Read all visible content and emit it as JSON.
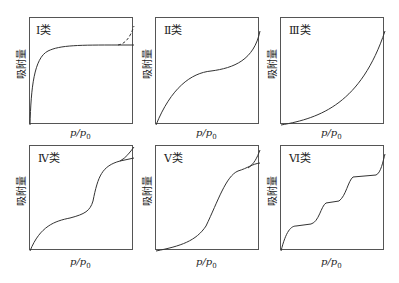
{
  "figure": {
    "ylabel": "吸附量",
    "xlabel_p": "p",
    "xlabel_sep": "/",
    "xlabel_p0": "p",
    "xlabel_sub": "0",
    "panels": [
      {
        "title": "Ⅰ类",
        "type": "I"
      },
      {
        "title": "Ⅱ类",
        "type": "II"
      },
      {
        "title": "Ⅲ类",
        "type": "III"
      },
      {
        "title": "Ⅳ类",
        "type": "IV"
      },
      {
        "title": "Ⅴ类",
        "type": "V"
      },
      {
        "title": "Ⅵ类",
        "type": "VI"
      }
    ]
  },
  "colors": {
    "line": "#333333",
    "border": "#555555"
  }
}
